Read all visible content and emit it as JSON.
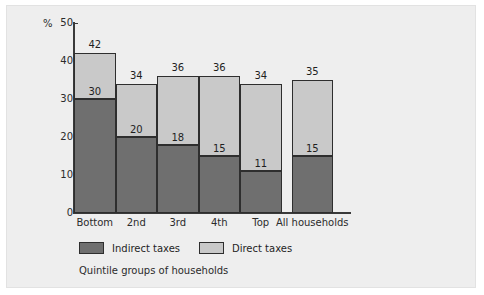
{
  "chart_data": {
    "type": "bar",
    "title": "",
    "subtitle": "",
    "xlabel": "Quintile groups of households",
    "ylabel": "%",
    "ylim": [
      0,
      50
    ],
    "yticks": [
      0,
      10,
      20,
      30,
      40,
      50
    ],
    "ytick_labels": [
      "0",
      "10",
      "20",
      "30",
      "40",
      "50"
    ],
    "grid": false,
    "stacked": true,
    "legend_position": "bottom",
    "categories": [
      "Bottom",
      "2nd",
      "3rd",
      "4th",
      "Top",
      "All households"
    ],
    "series": [
      {
        "name": "Indirect taxes",
        "color": "#6f6f6f",
        "values": [
          30,
          20,
          18,
          15,
          11,
          15
        ]
      },
      {
        "name": "Direct taxes",
        "color": "#c9c9c9",
        "values": [
          12,
          14,
          18,
          21,
          23,
          20
        ]
      }
    ],
    "totals": [
      42,
      34,
      36,
      36,
      34,
      35
    ],
    "total_labels": [
      "42",
      "34",
      "36",
      "36",
      "34",
      "35"
    ],
    "indirect_labels": [
      "30",
      "20",
      "18",
      "15",
      "11",
      "15"
    ]
  },
  "axis": {
    "unit_label": "%"
  },
  "legend": {
    "items": [
      {
        "label": "Indirect taxes",
        "swatch": "dark-gray-swatch"
      },
      {
        "label": "Direct taxes",
        "swatch": "light-gray-swatch"
      }
    ]
  },
  "caption": {
    "text": "Quintile groups of households"
  },
  "colors": {
    "indirect": "#6f6f6f",
    "direct": "#c9c9c9",
    "panel_background": "#eeeeee",
    "axis": "#3a3a3a",
    "text": "#1f1f1f"
  }
}
